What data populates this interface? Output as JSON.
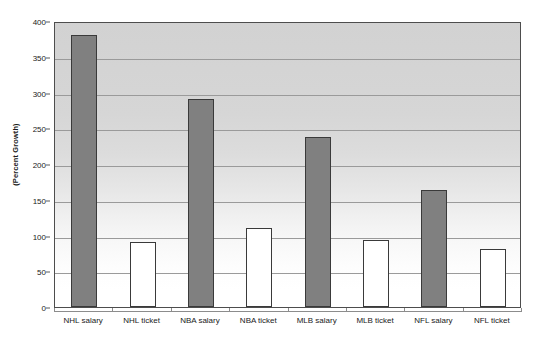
{
  "chart_data": {
    "type": "bar",
    "title": "",
    "subtitle": "",
    "xlabel": "",
    "ylabel": "(Percent Growth)",
    "categories": [
      "NHL salary",
      "NHL ticket",
      "NBA salary",
      "NBA ticket",
      "MLB salary",
      "MLB ticket",
      "NFL salary",
      "NFL ticket"
    ],
    "values": [
      381,
      91,
      291,
      110,
      238,
      94,
      164,
      81
    ],
    "bar_styles": [
      "filled",
      "hollow",
      "filled",
      "hollow",
      "filled",
      "hollow",
      "filled",
      "hollow"
    ],
    "ylim": [
      0,
      400
    ],
    "yticks": [
      0,
      50,
      100,
      150,
      200,
      250,
      300,
      350,
      400
    ],
    "ytick_labels": [
      "0",
      "50",
      "100",
      "150",
      "200",
      "250",
      "300",
      "350",
      "400"
    ],
    "grid": true,
    "legend": null,
    "colors": {
      "bar_filled": "#808080",
      "bar_hollow": "#ffffff",
      "bar_border": "#3a3a3a",
      "gridline": "#9a9a9a",
      "plot_border": "#4d4d4d",
      "plot_bg_top": "#d2d2d2",
      "plot_bg_bottom": "#ffffff",
      "text": "#1a1a1a"
    }
  }
}
